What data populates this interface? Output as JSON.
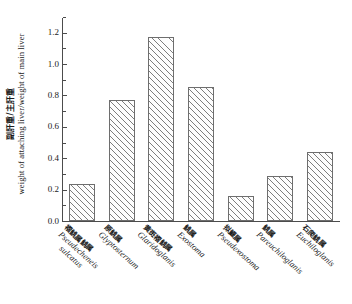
{
  "chart_data": {
    "type": "bar",
    "title": "",
    "subtitle": "",
    "xlabel": "",
    "ylabel_cn": "副肝重/主肝重",
    "ylabel_en": "weight of attaching liver/weight of main liver",
    "ylim": [
      0.0,
      1.3
    ],
    "ytick_labels": [
      "0.0",
      "0.2",
      "0.4",
      "0.6",
      "0.8",
      "1.0",
      "1.2"
    ],
    "ytick_values": [
      0.0,
      0.2,
      0.4,
      0.6,
      0.8,
      1.0,
      1.2
    ],
    "minor_ticks": true,
    "grid": false,
    "legend": "none",
    "categories": [
      "Pseudecheneis sulcatus",
      "Glyptosternum",
      "Glaridoglanis",
      "Exostoma",
      "Pseudexostoma",
      "Pareuchiloglanis",
      "Euchiloglanis"
    ],
    "categories_cn": [
      "褶鮡属鮡属",
      "原鮡属",
      "黄斑褶鮡属",
      "鮡属",
      "拟鰋属",
      "鮡属",
      "石爬鮡属"
    ],
    "values": [
      0.235,
      0.77,
      1.17,
      0.855,
      0.16,
      0.285,
      0.44
    ],
    "bars": [
      {
        "cn": "褶鮡属鮡属",
        "sci_line1": "Pseudecheneis",
        "sci_line2": "sulcatus",
        "value": 0.235
      },
      {
        "cn": "原鮡属",
        "sci_line1": "Glyptosternum",
        "sci_line2": "",
        "value": 0.77
      },
      {
        "cn": "黄斑褶鮡属",
        "sci_line1": "Glaridoglanis",
        "sci_line2": "",
        "value": 1.17
      },
      {
        "cn": "鮡属",
        "sci_line1": "Exostoma",
        "sci_line2": "",
        "value": 0.855
      },
      {
        "cn": "拟鰋属",
        "sci_line1": "Pseudexostoma",
        "sci_line2": "",
        "value": 0.16
      },
      {
        "cn": "鮡属",
        "sci_line1": "Pareuchiloglanis",
        "sci_line2": "",
        "value": 0.285
      },
      {
        "cn": "石爬鮡属",
        "sci_line1": "Euchiloglanis",
        "sci_line2": "",
        "value": 0.44
      }
    ],
    "colors": {
      "bar_fill": "#fdfdfd",
      "bar_hatch": "#7d7d7d",
      "bar_edge": "#6e6e6e",
      "axis": "#4c4c4c",
      "text": "#1b1b1b",
      "background": "#ffffff"
    }
  }
}
